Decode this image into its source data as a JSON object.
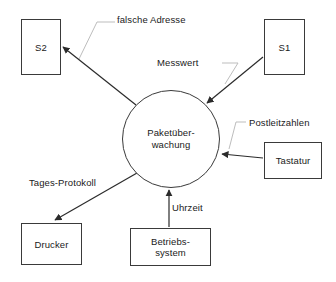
{
  "diagram": {
    "background_color": "#ffffff",
    "stroke_color": "#3a3a3a",
    "leader_color": "#b9b9b9",
    "text_color": "#1a1a1a",
    "process": {
      "id": "paketueberwachung",
      "shape": "circle",
      "label_line1": "Paketüber-",
      "label_line2": "wachung",
      "cx": 171,
      "cy": 139,
      "r": 49
    },
    "terminators": [
      {
        "id": "s2",
        "label": "S2",
        "x": 21,
        "y": 19,
        "w": 40,
        "h": 56
      },
      {
        "id": "s1",
        "label": "S1",
        "x": 264,
        "y": 19,
        "w": 41,
        "h": 56
      },
      {
        "id": "tastatur",
        "label": "Tastatur",
        "x": 264,
        "y": 142,
        "w": 58,
        "h": 37
      },
      {
        "id": "drucker",
        "label": "Drucker",
        "x": 21,
        "y": 223,
        "w": 61,
        "h": 42
      },
      {
        "id": "betriebssystem",
        "label_line1": "Betriebs-",
        "label_line2": "system",
        "x": 130,
        "y": 228,
        "w": 81,
        "h": 38
      }
    ],
    "flows": [
      {
        "id": "falsche-adresse",
        "label": "falsche Adresse",
        "from": "paketueberwachung",
        "to": "s2",
        "label_x": 117,
        "label_y": 14
      },
      {
        "id": "messwert",
        "label": "Messwert",
        "from": "s1",
        "to": "paketueberwachung",
        "label_x": 157,
        "label_y": 57
      },
      {
        "id": "postleitzahlen",
        "label": "Postleitzahlen",
        "from": "tastatur",
        "to": "paketueberwachung",
        "label_x": 249,
        "label_y": 117
      },
      {
        "id": "tages-protokoll",
        "label": "Tages-Protokoll",
        "from": "paketueberwachung",
        "to": "drucker",
        "label_x": 29,
        "label_y": 177
      },
      {
        "id": "uhrzeit",
        "label": "Uhrzeit",
        "from": "betriebssystem",
        "to": "paketueberwachung",
        "label_x": 172,
        "label_y": 202
      }
    ]
  }
}
